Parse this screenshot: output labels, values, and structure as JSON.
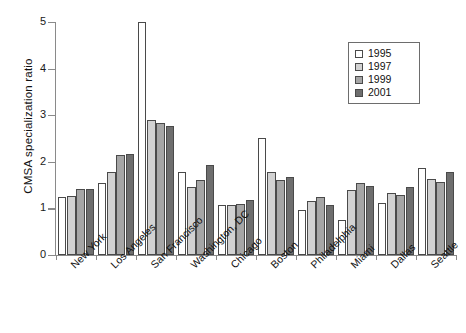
{
  "chart_data": {
    "type": "bar",
    "title": "",
    "xlabel": "",
    "ylabel": "CMSA specialization ratio",
    "ylim": [
      0,
      5
    ],
    "yticks": [
      0,
      1,
      2,
      3,
      4,
      5
    ],
    "grid": false,
    "legend_position": "top-right",
    "categories": [
      "New York",
      "Los Angeles",
      "San Francisco",
      "Washington, DC",
      "Chicago",
      "Boston",
      "Philadelphia",
      "Miami",
      "Dallas",
      "Seattle"
    ],
    "series": [
      {
        "name": "1995",
        "color": "#ffffff",
        "values": [
          1.25,
          1.55,
          5.0,
          1.78,
          1.07,
          2.52,
          0.97,
          0.75,
          1.12,
          1.87
        ]
      },
      {
        "name": "1997",
        "color": "#d2d2d2",
        "values": [
          1.27,
          1.78,
          2.9,
          1.45,
          1.08,
          1.78,
          1.15,
          1.4,
          1.33,
          1.63
        ]
      },
      {
        "name": "1999",
        "color": "#a6a6a6",
        "values": [
          1.42,
          2.15,
          2.83,
          1.6,
          1.09,
          1.62,
          1.25,
          1.55,
          1.28,
          1.57
        ]
      },
      {
        "name": "2001",
        "color": "#6e6e6e",
        "values": [
          1.42,
          2.17,
          2.76,
          1.93,
          1.18,
          1.68,
          1.08,
          1.48,
          1.45,
          1.78
        ]
      }
    ]
  },
  "legend": {
    "entries": [
      {
        "label": "1995",
        "color": "#ffffff"
      },
      {
        "label": "1997",
        "color": "#d2d2d2"
      },
      {
        "label": "1999",
        "color": "#a6a6a6"
      },
      {
        "label": "2001",
        "color": "#6e6e6e"
      }
    ]
  },
  "axis": {
    "y_title": "CMSA specialization ratio",
    "y_tick_labels": [
      "5",
      "4",
      "3",
      "2",
      "1",
      "0"
    ]
  }
}
